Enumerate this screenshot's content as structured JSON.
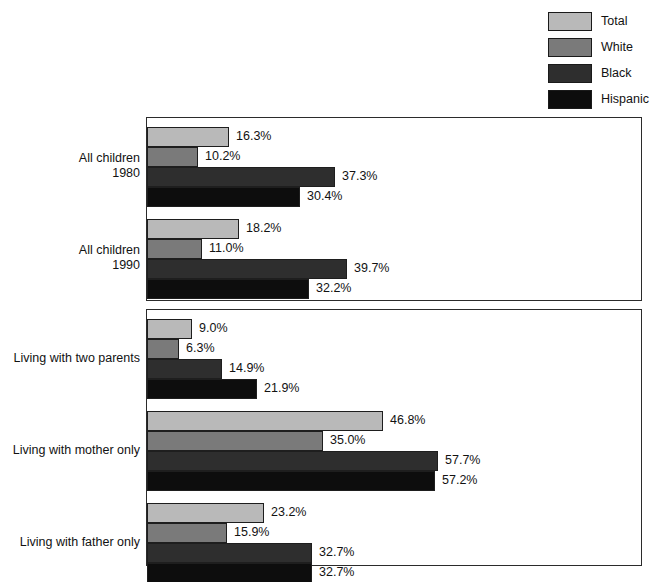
{
  "legend": {
    "items": [
      {
        "label": "Total",
        "color": "#b9b9b9"
      },
      {
        "label": "White",
        "color": "#7a7a7a"
      },
      {
        "label": "Black",
        "color": "#2e2e2e"
      },
      {
        "label": "Hispanic",
        "color": "#0d0d0d"
      }
    ]
  },
  "chart_data": {
    "type": "bar",
    "orientation": "horizontal",
    "title": "",
    "xlabel": "",
    "ylabel": "",
    "xlim": [
      0,
      60
    ],
    "grid": false,
    "legend_position": "top-right",
    "value_suffix": "%",
    "series": [
      {
        "name": "Total",
        "color": "#b9b9b9",
        "values": [
          16.3,
          18.2,
          9.0,
          46.8,
          23.2
        ]
      },
      {
        "name": "White",
        "color": "#7a7a7a",
        "values": [
          10.2,
          11.0,
          6.3,
          35.0,
          15.9
        ]
      },
      {
        "name": "Black",
        "color": "#2e2e2e",
        "values": [
          37.3,
          39.7,
          14.9,
          57.7,
          32.7
        ]
      },
      {
        "name": "Hispanic",
        "color": "#0d0d0d",
        "values": [
          30.4,
          32.2,
          21.9,
          57.2,
          32.7
        ]
      }
    ],
    "categories": [
      "All children 1980",
      "All children 1990",
      "Living with two parents",
      "Living with mother only",
      "Living with father only"
    ],
    "panels": [
      {
        "name": "all-children",
        "groups": [
          {
            "label_lines": [
              "All children",
              "1980"
            ],
            "bars": [
              {
                "series": "Total",
                "value": 16.3,
                "value_label": "16.3%",
                "color": "#b9b9b9"
              },
              {
                "series": "White",
                "value": 10.2,
                "value_label": "10.2%",
                "color": "#7a7a7a"
              },
              {
                "series": "Black",
                "value": 37.3,
                "value_label": "37.3%",
                "color": "#2e2e2e"
              },
              {
                "series": "Hispanic",
                "value": 30.4,
                "value_label": "30.4%",
                "color": "#0d0d0d"
              }
            ]
          },
          {
            "label_lines": [
              "All children",
              "1990"
            ],
            "bars": [
              {
                "series": "Total",
                "value": 18.2,
                "value_label": "18.2%",
                "color": "#b9b9b9"
              },
              {
                "series": "White",
                "value": 11.0,
                "value_label": "11.0%",
                "color": "#7a7a7a"
              },
              {
                "series": "Black",
                "value": 39.7,
                "value_label": "39.7%",
                "color": "#2e2e2e"
              },
              {
                "series": "Hispanic",
                "value": 32.2,
                "value_label": "32.2%",
                "color": "#0d0d0d"
              }
            ]
          }
        ]
      },
      {
        "name": "living-arrangement",
        "groups": [
          {
            "label_lines": [
              "Living with two parents"
            ],
            "bars": [
              {
                "series": "Total",
                "value": 9.0,
                "value_label": "9.0%",
                "color": "#b9b9b9"
              },
              {
                "series": "White",
                "value": 6.3,
                "value_label": "6.3%",
                "color": "#7a7a7a"
              },
              {
                "series": "Black",
                "value": 14.9,
                "value_label": "14.9%",
                "color": "#2e2e2e"
              },
              {
                "series": "Hispanic",
                "value": 21.9,
                "value_label": "21.9%",
                "color": "#0d0d0d"
              }
            ]
          },
          {
            "label_lines": [
              "Living with mother only"
            ],
            "bars": [
              {
                "series": "Total",
                "value": 46.8,
                "value_label": "46.8%",
                "color": "#b9b9b9"
              },
              {
                "series": "White",
                "value": 35.0,
                "value_label": "35.0%",
                "color": "#7a7a7a"
              },
              {
                "series": "Black",
                "value": 57.7,
                "value_label": "57.7%",
                "color": "#2e2e2e"
              },
              {
                "series": "Hispanic",
                "value": 57.2,
                "value_label": "57.2%",
                "color": "#0d0d0d"
              }
            ]
          },
          {
            "label_lines": [
              "Living with father only"
            ],
            "bars": [
              {
                "series": "Total",
                "value": 23.2,
                "value_label": "23.2%",
                "color": "#b9b9b9"
              },
              {
                "series": "White",
                "value": 15.9,
                "value_label": "15.9%",
                "color": "#7a7a7a"
              },
              {
                "series": "Black",
                "value": 32.7,
                "value_label": "32.7%",
                "color": "#2e2e2e"
              },
              {
                "series": "Hispanic",
                "value": 32.7,
                "value_label": "32.7%",
                "color": "#0d0d0d"
              }
            ]
          }
        ]
      }
    ]
  }
}
